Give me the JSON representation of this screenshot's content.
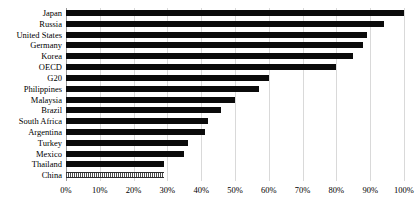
{
  "chart_data": {
    "type": "bar",
    "orientation": "horizontal",
    "title": "",
    "subtitle": "",
    "xlabel": "",
    "ylabel": "",
    "xlim": [
      0,
      100
    ],
    "xtick_labels": [
      "0%",
      "10%",
      "20%",
      "30%",
      "40%",
      "50%",
      "60%",
      "70%",
      "80%",
      "90%",
      "100%"
    ],
    "xticks": [
      0,
      10,
      20,
      30,
      40,
      50,
      60,
      70,
      80,
      90,
      100
    ],
    "grid": true,
    "grid_axis": "x",
    "legend": "none",
    "units": "percent",
    "categories": [
      "Japan",
      "Russia",
      "United States",
      "Germany",
      "Korea",
      "OECD",
      "G20",
      "Philippines",
      "Malaysia",
      "Brazil",
      "South Africa",
      "Argentina",
      "Turkey",
      "Mexico",
      "Thailand",
      "China"
    ],
    "values": [
      100,
      94,
      89,
      88,
      85,
      80,
      60,
      57,
      50,
      46,
      42,
      41,
      36,
      35,
      29,
      29
    ],
    "bar_styles": [
      "solid",
      "solid",
      "solid",
      "solid",
      "solid",
      "solid",
      "solid",
      "solid",
      "solid",
      "solid",
      "solid",
      "solid",
      "solid",
      "solid",
      "solid",
      "dotted"
    ],
    "colors": {
      "bar_solid": "#0b0b0b",
      "bar_pattern_fill": "#ffffff",
      "bar_pattern_line": "#4a4a4a",
      "gridline": "#d9d9d9",
      "axis": "#9a9a9a",
      "text": "#000000",
      "background": "#ffffff"
    }
  }
}
